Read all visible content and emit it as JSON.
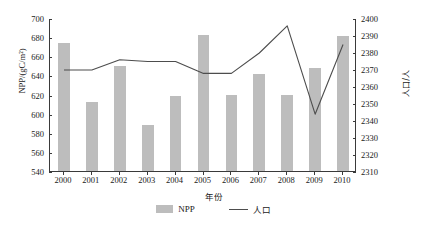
{
  "chart_data": {
    "type": "bar",
    "title": "",
    "subtitle": "",
    "xlabel": "年份",
    "ylabel": "NPP/(gC/m²)",
    "y2label": "人口/人",
    "categories": [
      "2000",
      "2001",
      "2002",
      "2003",
      "2004",
      "2005",
      "2006",
      "2007",
      "2008",
      "2009",
      "2010"
    ],
    "x": [
      2000,
      2001,
      2002,
      2003,
      2004,
      2005,
      2006,
      2007,
      2008,
      2009,
      2010
    ],
    "ylim": [
      540,
      700
    ],
    "y2lim": [
      2310,
      2400
    ],
    "ytick_step": 20,
    "y2tick_step": 10,
    "yticks": [
      700,
      680,
      660,
      640,
      620,
      600,
      580,
      560,
      540
    ],
    "y2ticks": [
      2400,
      2390,
      2380,
      2370,
      2360,
      2350,
      2340,
      2330,
      2320,
      2310
    ],
    "grid": false,
    "legend_position": "bottom",
    "series": [
      {
        "name": "NPP",
        "type": "bar",
        "axis": "left",
        "color": "#bdbdbd",
        "values": [
          674,
          612,
          650,
          588,
          618,
          682,
          619,
          641,
          619,
          648,
          681
        ]
      },
      {
        "name": "人口",
        "type": "line",
        "axis": "right",
        "color": "#4d4d4d",
        "values": [
          2370,
          2370,
          2376,
          2375,
          2375,
          2368,
          2368,
          2380,
          2396,
          2344,
          2385
        ]
      }
    ]
  },
  "legend": {
    "items": [
      {
        "label": "NPP",
        "marker": "bar-swatch"
      },
      {
        "label": "人口",
        "marker": "line-swatch"
      }
    ]
  },
  "axes": {
    "left_title": "NPP/(gC/m²)",
    "right_title": "人口/人",
    "bottom_title": "年份"
  }
}
